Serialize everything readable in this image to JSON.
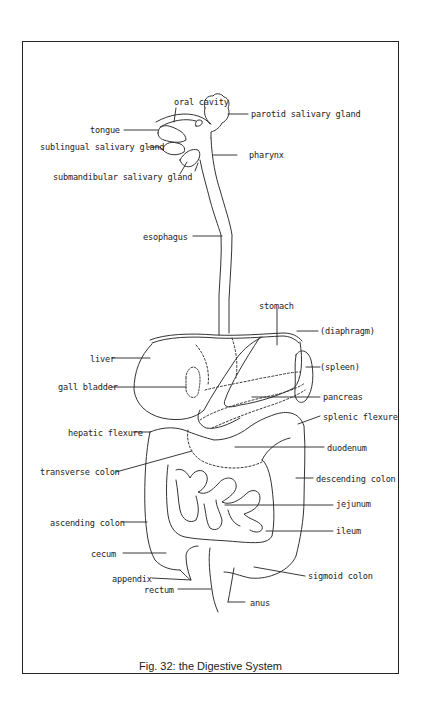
{
  "figure": {
    "caption": "Fig. 32: the Digestive System"
  },
  "labels": [
    {
      "id": "oral-cavity",
      "text": "oral cavity",
      "x": 174,
      "y": 97,
      "align": "left",
      "line": [
        [
          176,
          108
        ],
        [
          174,
          122
        ]
      ]
    },
    {
      "id": "parotid-salivary-gland",
      "text": "parotid salivary gland",
      "x": 251,
      "y": 109,
      "align": "left",
      "line": [
        [
          228,
          114
        ],
        [
          248,
          114
        ]
      ]
    },
    {
      "id": "tongue",
      "text": "tongue",
      "x": 90,
      "y": 125,
      "align": "left",
      "line": [
        [
          124,
          130
        ],
        [
          158,
          130
        ]
      ]
    },
    {
      "id": "sublingual-salivary-gland",
      "text": "sublingual salivary gland",
      "x": 40,
      "y": 142,
      "align": "left",
      "line": [
        [
          148,
          147
        ],
        [
          160,
          147
        ],
        [
          163,
          150
        ]
      ]
    },
    {
      "id": "pharynx",
      "text": "pharynx",
      "x": 249,
      "y": 150,
      "align": "left",
      "line": [
        [
          213,
          155
        ],
        [
          237,
          155
        ]
      ]
    },
    {
      "id": "submandibular-salivary-gland",
      "text": "submandibular salivary gland",
      "x": 53,
      "y": 172,
      "align": "left",
      "line": [
        [
          180,
          174
        ],
        [
          187,
          162
        ]
      ]
    },
    {
      "id": "esophagus",
      "text": "esophagus",
      "x": 143,
      "y": 232,
      "align": "left",
      "line": [
        [
          193,
          236
        ],
        [
          222,
          236
        ]
      ]
    },
    {
      "id": "stomach",
      "text": "stomach",
      "x": 259,
      "y": 301,
      "align": "left",
      "line": [
        [
          277,
          309
        ],
        [
          277,
          345
        ]
      ]
    },
    {
      "id": "diaphragm",
      "text": "(diaphragm)",
      "x": 320,
      "y": 326,
      "align": "left",
      "line": [
        [
          297,
          331
        ],
        [
          318,
          331
        ]
      ]
    },
    {
      "id": "liver",
      "text": "liver",
      "x": 90,
      "y": 354,
      "align": "left",
      "line": [
        [
          112,
          358
        ],
        [
          150,
          358
        ]
      ]
    },
    {
      "id": "spleen",
      "text": "(spleen)",
      "x": 320,
      "y": 362,
      "align": "left",
      "line": [
        [
          306,
          367
        ],
        [
          320,
          367
        ]
      ]
    },
    {
      "id": "gall-bladder",
      "text": "gall bladder",
      "x": 58,
      "y": 382,
      "align": "left",
      "line": [
        [
          111,
          387
        ],
        [
          186,
          387
        ]
      ]
    },
    {
      "id": "pancreas",
      "text": "pancreas",
      "x": 323,
      "y": 392,
      "align": "left",
      "line": [
        [
          252,
          397
        ],
        [
          320,
          397
        ]
      ]
    },
    {
      "id": "splenic-flexure",
      "text": "splenic flexure",
      "x": 323,
      "y": 412,
      "align": "left",
      "line": [
        [
          298,
          424
        ],
        [
          320,
          416
        ]
      ]
    },
    {
      "id": "hepatic-flexure",
      "text": "hepatic flexure",
      "x": 68,
      "y": 428,
      "align": "left",
      "line": [
        [
          133,
          432
        ],
        [
          150,
          432
        ]
      ]
    },
    {
      "id": "duodenum",
      "text": "duodenum",
      "x": 327,
      "y": 443,
      "align": "left",
      "line": [
        [
          235,
          447
        ],
        [
          324,
          447
        ]
      ]
    },
    {
      "id": "transverse-colon",
      "text": "transverse colon",
      "x": 40,
      "y": 467,
      "align": "left",
      "line": [
        [
          116,
          472
        ],
        [
          192,
          451
        ]
      ]
    },
    {
      "id": "descending-colon",
      "text": "descending colon",
      "x": 316,
      "y": 474,
      "align": "left",
      "line": [
        [
          296,
          478
        ],
        [
          313,
          478
        ]
      ]
    },
    {
      "id": "jejunum",
      "text": "jejunum",
      "x": 336,
      "y": 499,
      "align": "left",
      "line": [
        [
          225,
          505
        ],
        [
          333,
          505
        ]
      ]
    },
    {
      "id": "ascending-colon",
      "text": "ascending colon",
      "x": 50,
      "y": 518,
      "align": "left",
      "line": [
        [
          122,
          522
        ],
        [
          147,
          522
        ]
      ]
    },
    {
      "id": "ileum",
      "text": "ileum",
      "x": 336,
      "y": 526,
      "align": "left",
      "line": [
        [
          266,
          531
        ],
        [
          333,
          531
        ]
      ]
    },
    {
      "id": "cecum",
      "text": "cecum",
      "x": 91,
      "y": 549,
      "align": "left",
      "line": [
        [
          123,
          553
        ],
        [
          166,
          553
        ]
      ]
    },
    {
      "id": "sigmoid-colon",
      "text": "sigmoid colon",
      "x": 308,
      "y": 571,
      "align": "left",
      "line": [
        [
          254,
          567
        ],
        [
          305,
          576
        ]
      ]
    },
    {
      "id": "appendix",
      "text": "appendix",
      "x": 112,
      "y": 574,
      "align": "left",
      "line": [
        [
          152,
          578
        ],
        [
          191,
          580
        ]
      ]
    },
    {
      "id": "rectum",
      "text": "rectum",
      "x": 144,
      "y": 585,
      "align": "left",
      "line": [
        [
          178,
          589
        ],
        [
          211,
          589
        ]
      ]
    },
    {
      "id": "anus",
      "text": "anus",
      "x": 250,
      "y": 598,
      "align": "left",
      "line": [
        [
          228,
          602
        ],
        [
          245,
          602
        ]
      ]
    }
  ],
  "colors": {
    "ink": "#222222",
    "background": "#ffffff"
  }
}
